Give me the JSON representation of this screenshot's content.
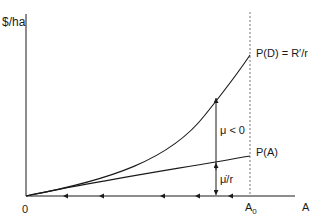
{
  "diagram": {
    "y_axis_label": "$/ha",
    "x_axis_label": "A",
    "origin_label": "0",
    "boundary_label_main": "A",
    "boundary_label_sub": "0",
    "curve_upper_label": "P(D) = R′/r",
    "curve_lower_label": "P(A)",
    "gap_upper_label": "μ < 0",
    "gap_lower_label": "μ̇/r",
    "colors": {
      "line": "#1a1a1a",
      "dashed": "#777777",
      "background": "#ffffff"
    }
  }
}
